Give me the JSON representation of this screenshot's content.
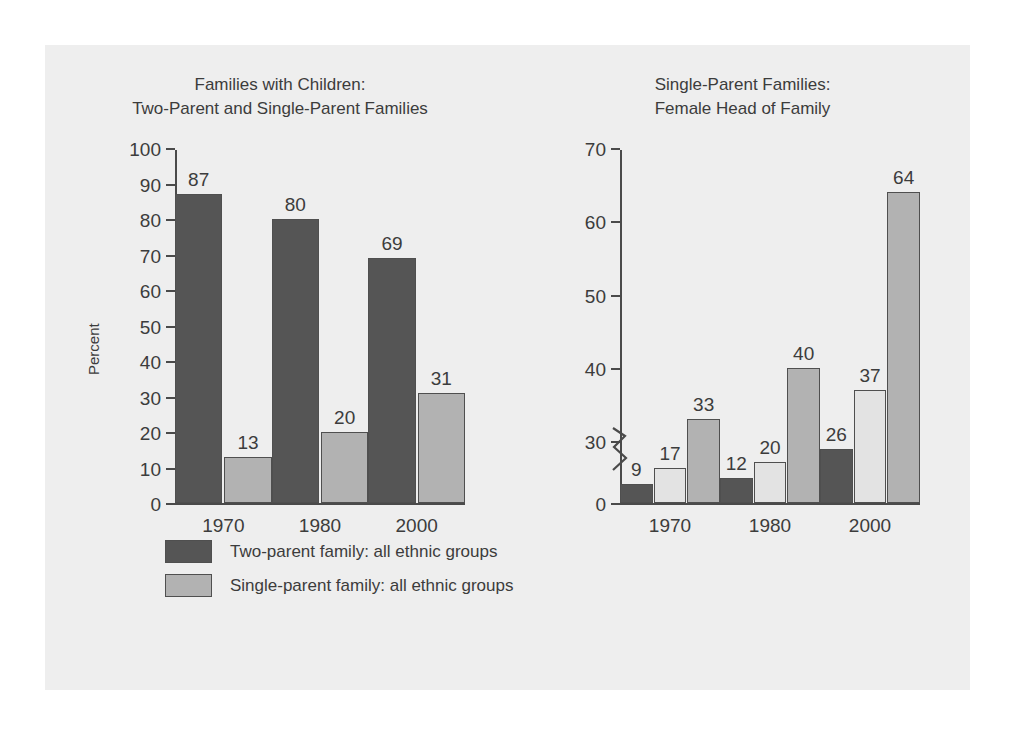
{
  "colors": {
    "page_background": "#ffffff",
    "panel_background": "#eeeeee",
    "dark_bar": "#555555",
    "medium_bar": "#b2b2b2",
    "light_bar": "#e3e3e3",
    "outline": "#4f4f4f",
    "text": "#3c3c3c"
  },
  "chart_data": [
    {
      "id": "families-with-children",
      "type": "bar",
      "title": "Families with Children:\nTwo-Parent and Single-Parent Families",
      "xlabel": "",
      "ylabel": "Percent",
      "categories": [
        "1970",
        "1980",
        "2000"
      ],
      "ylim": [
        0,
        100
      ],
      "yticks": [
        0,
        10,
        20,
        30,
        40,
        50,
        60,
        70,
        80,
        90,
        100
      ],
      "grid": false,
      "legend_position": "below",
      "axis_break": false,
      "series": [
        {
          "name": "Two-parent family: all ethnic groups",
          "color": "#555555",
          "values": [
            87,
            80,
            69
          ]
        },
        {
          "name": "Single-parent family: all ethnic groups",
          "color": "#b2b2b2",
          "values": [
            13,
            20,
            31
          ]
        }
      ]
    },
    {
      "id": "single-parent-female-head",
      "type": "bar",
      "title": "Single-Parent Families:\nFemale Head of Family",
      "xlabel": "",
      "ylabel": "Percent",
      "categories": [
        "1970",
        "1980",
        "2000"
      ],
      "ylim": [
        0,
        70
      ],
      "yticks": [
        0,
        30,
        40,
        50,
        60,
        70
      ],
      "grid": false,
      "legend_position": "below",
      "axis_break": true,
      "axis_break_note": "zigzag break between 0 and 30",
      "series": [
        {
          "name": "Caucasian",
          "color": "#555555",
          "values": [
            9,
            12,
            26
          ]
        },
        {
          "name": "Mexican American",
          "color": "#e3e3e3",
          "values": [
            17,
            20,
            37
          ]
        },
        {
          "name": "African American",
          "color": "#b2b2b2",
          "values": [
            33,
            40,
            64
          ]
        }
      ]
    }
  ]
}
